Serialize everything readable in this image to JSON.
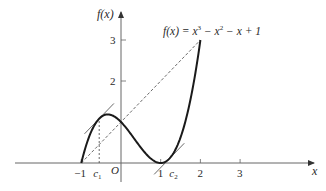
{
  "chart_data": {
    "type": "line",
    "title": "",
    "function_label": "f(x) = x³ − x² − x + 1",
    "function_label_parts": {
      "lhs": "f(x) = x",
      "exp1": "3",
      "mid": " − x",
      "exp2": "2",
      "rhs": " − x + 1"
    },
    "xlabel": "x",
    "ylabel": "f(x)",
    "origin_label": "O",
    "x_ticks": [
      {
        "value": -1,
        "label": "−1"
      },
      {
        "value": 1,
        "label": "1"
      },
      {
        "value": 2,
        "label": "2"
      },
      {
        "value": 3,
        "label": "3"
      }
    ],
    "y_ticks": [
      {
        "value": 2,
        "label": "2"
      },
      {
        "value": 3,
        "label": "3"
      }
    ],
    "special_points": [
      {
        "name": "c1",
        "label": "c",
        "sub": "1",
        "x": -0.549
      },
      {
        "name": "c2",
        "label": "c",
        "sub": "2",
        "x": 1.215
      }
    ],
    "xlim": [
      -2.2,
      3.6
    ],
    "ylim": [
      -0.5,
      3.6
    ],
    "grid": false,
    "series": [
      {
        "name": "f(x)",
        "domain": [
          -1,
          2
        ],
        "expr": "x^3 - x^2 - x + 1",
        "style": "solid-thick"
      },
      {
        "name": "secant",
        "points": [
          [
            -1,
            0
          ],
          [
            2,
            3
          ]
        ],
        "style": "dashed",
        "slope": 1
      },
      {
        "name": "tangent at c1",
        "through_x": -0.549,
        "slope": 1,
        "style": "solid-thin"
      },
      {
        "name": "tangent at c2",
        "through_x": 1.215,
        "slope": 1,
        "style": "solid-thin"
      },
      {
        "name": "vertical at c1",
        "x": -0.549,
        "style": "dashed"
      }
    ],
    "colors": {
      "curve": "#1a1a1a",
      "axes": "#555555",
      "lines": "#444444"
    }
  }
}
